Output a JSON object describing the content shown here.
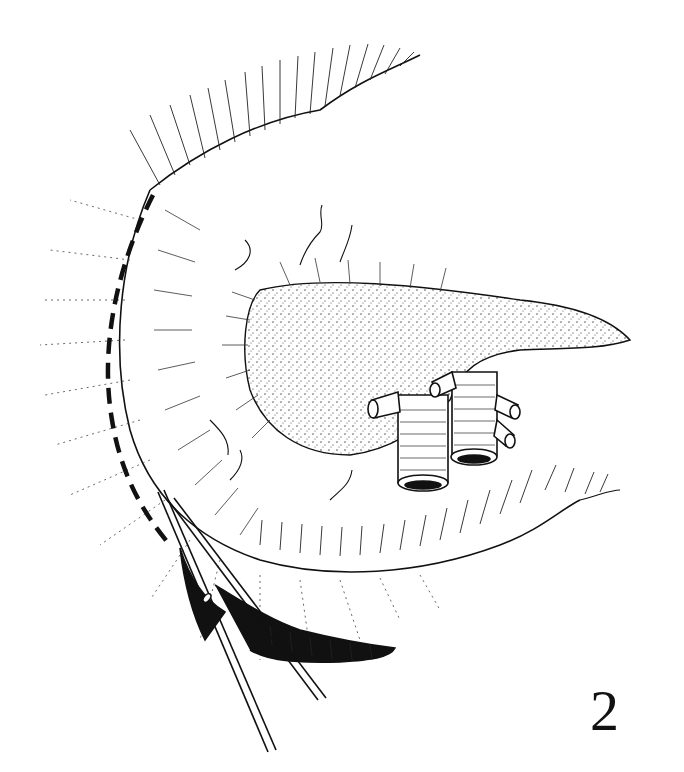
{
  "figure": {
    "number_label": "2",
    "style": "black-and-white surgical line illustration",
    "colors": {
      "ink": "#111111",
      "background": "#ffffff"
    },
    "elements": [
      "stomach-mobilized",
      "pancreas-stippled",
      "transected-vessels",
      "dashed-incision-line",
      "surgical-clamp",
      "omentum-fold"
    ]
  }
}
